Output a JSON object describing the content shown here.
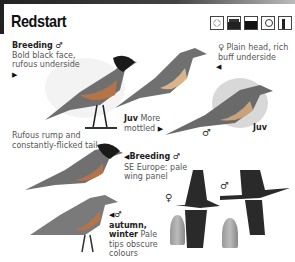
{
  "header": {
    "title": "Redstart",
    "habitat_icons": [
      "sun-heath-icon",
      "water-icon",
      "field-icon",
      "tree-icon",
      "forest-icon"
    ]
  },
  "labels": {
    "breeding_male": {
      "heading": "Breeding ♂",
      "text_1": "Bold black face,",
      "text_2": "rufous underside"
    },
    "female": {
      "heading": "♀ Plain head, rich",
      "text_2": "buff underside"
    },
    "juv_1": {
      "heading": "Juv",
      "text_1": "More",
      "text_2": "mottled"
    },
    "juv_2": {
      "heading": "Juv"
    },
    "rump": {
      "text_1": "Rufous rump and",
      "text_2": "constantly-flicked tail"
    },
    "breeding_se": {
      "heading": "Breeding ♂",
      "text_1": "SE Europe: pale",
      "text_2": "wing panel"
    },
    "autumn": {
      "heading_1": "♂",
      "heading_2": "autumn,",
      "heading_3": "winter",
      "text_1": "Pale",
      "text_2": "tips obscure",
      "text_3": "colours"
    },
    "flight_female": "♀",
    "flight_male": "♂",
    "perched_male_small": "♂"
  },
  "colors": {
    "rufous": "#b5734a",
    "bird_grey": "#6f6f6f",
    "black_face": "#1a1a1a",
    "buff": "#d9b48a"
  }
}
